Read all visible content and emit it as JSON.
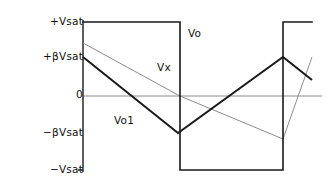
{
  "figure": {
    "background_color": "#ffffff",
    "line_color_bold": "#1a1a1a",
    "line_color_thin": "#8c8c8c",
    "axis_color": "#1a1a1a"
  },
  "axis": {
    "name": "vertical-voltage-axis",
    "x_px": 83,
    "labels": [
      {
        "id": "vsat-pos",
        "text": "+Vsat",
        "y_px": 22
      },
      {
        "id": "bvsat-pos",
        "text": "+βVsat",
        "y_px": 57
      },
      {
        "id": "zero",
        "text": "0",
        "y_px": 95
      },
      {
        "id": "bvsat-neg",
        "text": "−βVsat",
        "y_px": 133
      },
      {
        "id": "vsat-neg",
        "text": "−Vsat",
        "y_px": 170
      }
    ]
  },
  "curve_labels": {
    "vo": "Vo",
    "vx": "Vx",
    "vo1": "Vo1"
  },
  "chart_data": {
    "type": "line",
    "title": "",
    "xlabel": "",
    "ylabel": "",
    "grid": false,
    "legend": "inline-annotations",
    "ylim": [
      -1.0,
      1.0
    ],
    "ytick_values": [
      1.0,
      0.5,
      0.0,
      -0.5,
      -1.0
    ],
    "ytick_labels": [
      "+Vsat",
      "+βVsat",
      "0",
      "−βVsat",
      "−Vsat"
    ],
    "xlim": [
      0,
      327
    ],
    "series": [
      {
        "name": "Vo",
        "style": "square-wave-bold",
        "description": "Comparator output square wave switching between +Vsat and -Vsat",
        "points_px": [
          [
            83,
            22
          ],
          [
            180,
            22
          ],
          [
            180,
            170
          ],
          [
            283,
            170
          ],
          [
            283,
            22
          ],
          [
            312,
            22
          ]
        ]
      },
      {
        "name": "Vo1",
        "style": "triangle-wave-bold",
        "description": "Integrator triangular output ramping between +βVsat and -βVsat",
        "points_px": [
          [
            83,
            57
          ],
          [
            178,
            133
          ],
          [
            283,
            57
          ],
          [
            312,
            80
          ]
        ]
      },
      {
        "name": "Vx",
        "style": "triangle-wave-thin",
        "description": "Feedback node voltage, thin trace offset from Vo1",
        "points_px": [
          [
            83,
            43
          ],
          [
            180,
            96
          ],
          [
            283,
            139
          ],
          [
            312,
            57
          ]
        ]
      },
      {
        "name": "zero-baseline",
        "style": "horizontal-thin",
        "description": "Zero volt reference line",
        "points_px": [
          [
            83,
            96
          ],
          [
            322,
            96
          ]
        ]
      }
    ]
  }
}
